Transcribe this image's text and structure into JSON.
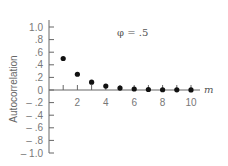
{
  "chart_data": {
    "type": "scatter",
    "title": "",
    "annotation": "φ = .5",
    "xlabel": "m",
    "ylabel": "Autocorrelation",
    "x": [
      1,
      2,
      3,
      4,
      5,
      6,
      7,
      8,
      9,
      10
    ],
    "values": [
      0.5,
      0.25,
      0.125,
      0.0625,
      0.03125,
      0.015625,
      0.0078,
      0.0039,
      0.002,
      0.001
    ],
    "xlim": [
      0,
      10.5
    ],
    "ylim": [
      -1.0,
      1.0
    ],
    "xticks": [
      2,
      4,
      6,
      8,
      10
    ],
    "xtick_labels": [
      "2",
      "4",
      "6",
      "8",
      "10"
    ],
    "yticks": [
      1.0,
      0.8,
      0.6,
      0.4,
      0.2,
      0,
      -0.2,
      -0.4,
      -0.6,
      -0.8,
      -1.0
    ],
    "ytick_labels": [
      "1.0",
      ".8",
      ".6",
      ".4",
      ".2",
      "0",
      "– .2",
      "– .4",
      "– .6",
      "– .8",
      "– 1.0"
    ],
    "grid": false,
    "legend": null
  }
}
